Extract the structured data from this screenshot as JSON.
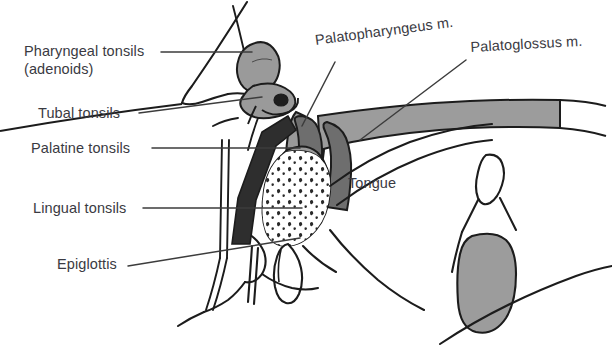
{
  "figure": {
    "view": "mid-sagittal section of head and neck",
    "background_color": "#ffffff",
    "line_color": "#1c1c1c",
    "text_color": "#3a3a42",
    "leader_color": "#3c3c3c",
    "palette": {
      "tissue_grey": "#9c9c9c",
      "tissue_grey_light": "#b2b2b2",
      "muscle_dark": "#2e2e2e",
      "muscle_mid": "#6e6e6e",
      "tonsil_grey": "#9a9a9a",
      "stipple": "#2a2a2a",
      "white_fill": "#ffffff"
    }
  },
  "labels": {
    "pharyngeal_tonsils_line1": "Pharyngeal tonsils",
    "pharyngeal_tonsils_line2": "(adenoids)",
    "tubal_tonsils": "Tubal tonsils",
    "palatine_tonsils": "Palatine tonsils",
    "lingual_tonsils": "Lingual tonsils",
    "epiglottis": "Epiglottis",
    "palatopharyngeus": "Palatopharyngeus m.",
    "palatoglossus": "Palatoglossus m.",
    "tongue": "Tongue"
  },
  "structures": [
    {
      "name": "pharyngeal-tonsil-adenoid",
      "label": "Pharyngeal tonsils (adenoids)",
      "side": "left",
      "fill": "#9a9a9a"
    },
    {
      "name": "tubal-tonsil",
      "label": "Tubal tonsils",
      "side": "left",
      "fill": "#9a9a9a"
    },
    {
      "name": "palatine-tonsil",
      "label": "Palatine tonsils",
      "side": "left",
      "fill": "#9a9a9a"
    },
    {
      "name": "lingual-tonsil",
      "label": "Lingual tonsils",
      "side": "left",
      "fill": "#9a9a9a"
    },
    {
      "name": "epiglottis",
      "label": "Epiglottis",
      "side": "left",
      "fill": "#ffffff"
    },
    {
      "name": "palatopharyngeus-muscle",
      "label": "Palatopharyngeus m.",
      "side": "right",
      "fill": "#6e6e6e"
    },
    {
      "name": "palatoglossus-muscle",
      "label": "Palatoglossus m.",
      "side": "right",
      "fill": "#6e6e6e"
    },
    {
      "name": "tongue",
      "label": "Tongue",
      "side": "right",
      "fill": "#ffffff"
    }
  ]
}
